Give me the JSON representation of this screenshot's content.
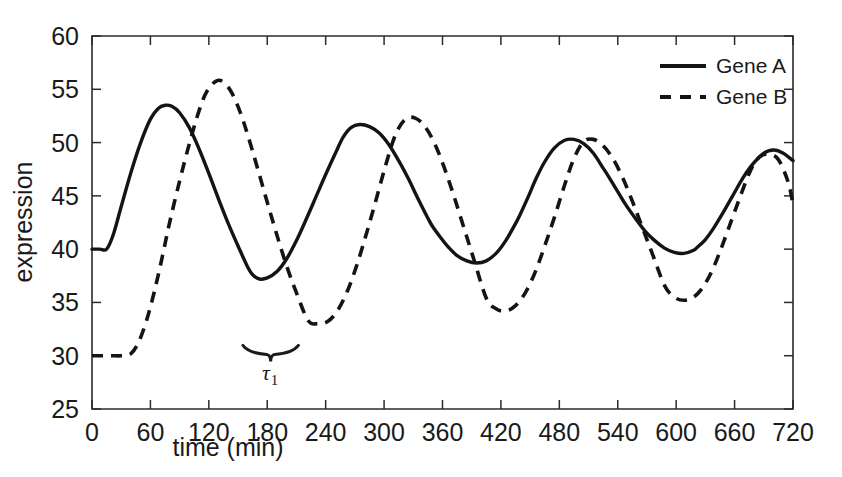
{
  "chart_data": {
    "type": "line",
    "title": "",
    "xlabel": "time (min)",
    "ylabel": "expression",
    "xlim": [
      0,
      720
    ],
    "ylim": [
      25,
      60
    ],
    "xticks": [
      0,
      60,
      120,
      180,
      240,
      300,
      360,
      420,
      480,
      540,
      600,
      660,
      720
    ],
    "yticks": [
      25,
      30,
      35,
      40,
      45,
      50,
      55,
      60
    ],
    "xtick_labels": [
      "0",
      "60",
      "120",
      "180",
      "240",
      "300",
      "360",
      "420",
      "480",
      "540",
      "600",
      "660",
      "720"
    ],
    "ytick_labels": [
      "25",
      "30",
      "35",
      "40",
      "45",
      "50",
      "55",
      "60"
    ],
    "grid": false,
    "legend_position": "top-right",
    "series": [
      {
        "name": "Gene A",
        "style": "solid",
        "color": "#141414",
        "x": [
          0,
          8,
          15,
          22,
          30,
          40,
          50,
          60,
          68,
          75,
          82,
          90,
          100,
          110,
          120,
          130,
          140,
          150,
          160,
          165,
          172,
          180,
          190,
          200,
          210,
          220,
          230,
          240,
          250,
          258,
          266,
          275,
          285,
          295,
          305,
          315,
          325,
          335,
          345,
          350,
          358,
          366,
          375,
          385,
          395,
          405,
          415,
          425,
          435,
          440,
          448,
          456,
          465,
          475,
          485,
          495,
          505,
          515,
          525,
          532,
          540,
          548,
          558,
          568,
          578,
          588,
          598,
          608,
          618,
          622,
          630,
          638,
          648,
          658,
          668,
          678,
          690,
          700,
          710,
          720
        ],
        "y": [
          40.0,
          40.0,
          40.0,
          41.4,
          44.0,
          47.2,
          50.0,
          52.2,
          53.2,
          53.5,
          53.4,
          52.8,
          51.4,
          49.4,
          47.1,
          44.7,
          42.4,
          40.3,
          38.3,
          37.6,
          37.2,
          37.3,
          37.9,
          39.1,
          40.8,
          42.8,
          44.9,
          47.0,
          49.0,
          50.5,
          51.4,
          51.7,
          51.5,
          50.9,
          49.8,
          48.3,
          46.6,
          44.7,
          42.9,
          42.1,
          41.1,
          40.2,
          39.4,
          38.9,
          38.7,
          38.9,
          39.6,
          40.8,
          42.4,
          43.3,
          44.9,
          46.6,
          48.2,
          49.5,
          50.2,
          50.3,
          49.9,
          49.0,
          47.6,
          46.6,
          45.4,
          44.2,
          42.9,
          41.7,
          40.8,
          40.1,
          39.7,
          39.6,
          39.9,
          40.2,
          40.9,
          41.9,
          43.4,
          45.0,
          46.6,
          47.9,
          49.0,
          49.3,
          49.0,
          48.3
        ],
        "peaks": [
          {
            "x": 75,
            "y": 53.5
          },
          {
            "x": 258,
            "y": 51.7
          },
          {
            "x": 440,
            "y": 50.3
          },
          {
            "x": 622,
            "y": 49.3
          }
        ],
        "troughs": [
          {
            "x": 165,
            "y": 37.2
          },
          {
            "x": 350,
            "y": 38.7
          },
          {
            "x": 532,
            "y": 39.6
          }
        ],
        "initial_value": 40.0,
        "flat_until_x": 15,
        "final_value": 40.8
      },
      {
        "name": "Gene B",
        "style": "dashed",
        "color": "#141414",
        "x": [
          0,
          10,
          20,
          30,
          40,
          48,
          56,
          64,
          72,
          80,
          90,
          100,
          110,
          118,
          128,
          136,
          144,
          152,
          160,
          170,
          180,
          190,
          200,
          210,
          222,
          232,
          242,
          252,
          262,
          272,
          282,
          292,
          302,
          312,
          322,
          332,
          342,
          352,
          362,
          372,
          382,
          392,
          405,
          415,
          425,
          435,
          445,
          455,
          465,
          475,
          485,
          495,
          505,
          515,
          525,
          535,
          545,
          555,
          565,
          575,
          588,
          598,
          608,
          618,
          628,
          638,
          648,
          660,
          675,
          685,
          695,
          705,
          715,
          720
        ],
        "y": [
          30.0,
          30.0,
          30.0,
          30.0,
          30.2,
          31.3,
          33.3,
          36.0,
          39.2,
          42.6,
          46.4,
          49.9,
          53.0,
          54.8,
          55.8,
          55.6,
          54.6,
          52.9,
          50.7,
          47.6,
          44.4,
          41.3,
          38.4,
          35.9,
          33.3,
          33.0,
          33.2,
          34.2,
          36.0,
          38.5,
          41.5,
          44.7,
          48.0,
          50.8,
          52.2,
          52.3,
          51.5,
          49.9,
          47.6,
          44.9,
          42.0,
          39.1,
          35.4,
          34.4,
          34.2,
          34.7,
          35.9,
          37.8,
          40.3,
          43.0,
          45.9,
          48.5,
          50.1,
          50.3,
          49.7,
          48.5,
          46.7,
          44.5,
          42.1,
          39.7,
          36.6,
          35.5,
          35.2,
          35.5,
          36.5,
          38.2,
          40.5,
          43.5,
          47.1,
          48.6,
          48.9,
          48.4,
          46.3,
          44.2
        ],
        "peaks": [
          {
            "x": 128,
            "y": 55.8
          },
          {
            "x": 312,
            "y": 52.3
          },
          {
            "x": 495,
            "y": 50.3
          },
          {
            "x": 675,
            "y": 48.9
          }
        ],
        "troughs": [
          {
            "x": 222,
            "y": 33.0
          },
          {
            "x": 405,
            "y": 34.2
          },
          {
            "x": 588,
            "y": 35.2
          }
        ],
        "initial_value": 30.0,
        "flat_until_x": 40,
        "final_value": 44.2
      }
    ],
    "annotations": [
      {
        "type": "brace",
        "label": "τ",
        "subscript": "1",
        "x_start": 155,
        "x_end": 212,
        "y": 30.5,
        "label_x": 183,
        "label_y": 28.5
      }
    ]
  },
  "legend": {
    "items": [
      {
        "label": "Gene A",
        "style": "solid"
      },
      {
        "label": "Gene B",
        "style": "dashed"
      }
    ]
  }
}
